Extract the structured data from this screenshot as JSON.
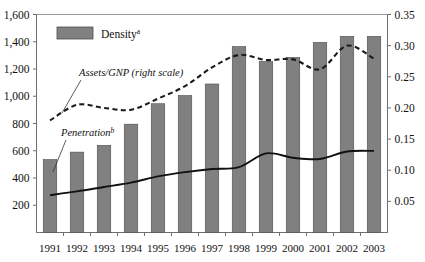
{
  "chart_data": {
    "type": "bar",
    "title": "",
    "xlabel": "",
    "ylabel": "",
    "grid": false,
    "legend_position": "inside-top-left",
    "categories": [
      "1991",
      "1992",
      "1993",
      "1994",
      "1995",
      "1996",
      "1997",
      "1998",
      "1999",
      "2000",
      "2001",
      "2002",
      "2003"
    ],
    "left_axis": {
      "label": "",
      "ylim": [
        0,
        1600
      ],
      "tick_values": [
        200,
        400,
        600,
        800,
        1000,
        1200,
        1400,
        1600
      ],
      "tick_labels": [
        "200",
        "400",
        "600",
        "800",
        "1,000",
        "1,200",
        "1,400",
        "1,600"
      ]
    },
    "right_axis": {
      "label": "",
      "ylim": [
        0,
        0.35
      ],
      "tick_values": [
        0.05,
        0.1,
        0.15,
        0.2,
        0.25,
        0.3,
        0.35
      ],
      "tick_labels": [
        "0.05",
        "0.10",
        "0.15",
        "0.20",
        "0.25",
        "0.30",
        "0.35"
      ]
    },
    "series": [
      {
        "name": "Density",
        "render": "bar",
        "axis": "left",
        "color": "#808080",
        "values": [
          535,
          590,
          640,
          795,
          945,
          1005,
          1090,
          1365,
          1255,
          1285,
          1395,
          1440,
          1440
        ]
      },
      {
        "name": "Assets/GNP (right scale)",
        "render": "line-dashed",
        "axis": "right",
        "color": "#1a1a1a",
        "values": [
          0.18,
          0.205,
          0.2,
          0.197,
          0.215,
          0.235,
          0.265,
          0.285,
          0.277,
          0.278,
          0.262,
          0.3,
          0.279
        ]
      },
      {
        "name": "Penetration",
        "render": "line-solid",
        "axis": "right",
        "color": "#111111",
        "values": [
          0.06,
          0.066,
          0.073,
          0.08,
          0.09,
          0.097,
          0.102,
          0.105,
          0.127,
          0.12,
          0.118,
          0.13,
          0.131
        ]
      }
    ]
  },
  "legend": {
    "density": {
      "label": "Density",
      "superscript": "a"
    }
  },
  "annotations": {
    "assets_gnp": {
      "text": "Assets/GNP (right scale)"
    },
    "penetration": {
      "text": "Penetration",
      "superscript": "b"
    }
  }
}
